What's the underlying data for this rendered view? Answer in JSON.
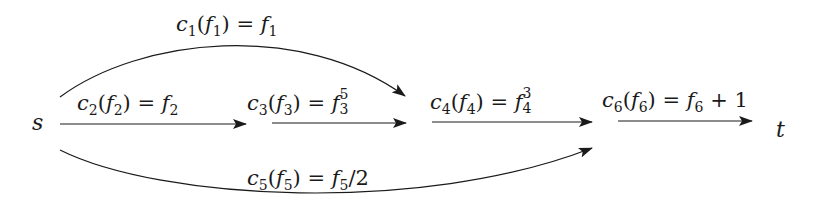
{
  "nodes": {
    "source": "s",
    "sink": "t"
  },
  "edges": [
    {
      "id": "e1",
      "cost": "c",
      "index": "1",
      "flow": "f",
      "result": "f",
      "result_index": "1",
      "result_exp": "",
      "extra": "",
      "type": "curve-up"
    },
    {
      "id": "e2",
      "cost": "c",
      "index": "2",
      "flow": "f",
      "result": "f",
      "result_index": "2",
      "result_exp": "",
      "extra": "",
      "type": "straight"
    },
    {
      "id": "e3",
      "cost": "c",
      "index": "3",
      "flow": "f",
      "result": "f",
      "result_index": "3",
      "result_exp": "5",
      "extra": "",
      "type": "straight"
    },
    {
      "id": "e4",
      "cost": "c",
      "index": "4",
      "flow": "f",
      "result": "f",
      "result_index": "4",
      "result_exp": "3",
      "extra": "",
      "type": "straight"
    },
    {
      "id": "e5",
      "cost": "c",
      "index": "5",
      "flow": "f",
      "result": "f",
      "result_index": "5",
      "result_exp": "",
      "extra": "/2",
      "type": "curve-down"
    },
    {
      "id": "e6",
      "cost": "c",
      "index": "6",
      "flow": "f",
      "result": "f",
      "result_index": "6",
      "result_exp": "",
      "extra": " + 1",
      "type": "straight"
    }
  ],
  "symbols": {
    "open": "(",
    "close": ")",
    "equals": " = "
  },
  "colors": {
    "stroke": "#1a1a1a",
    "background": "#ffffff"
  }
}
